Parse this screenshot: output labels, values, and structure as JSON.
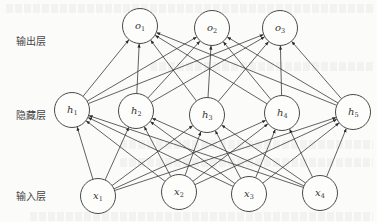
{
  "diagram": {
    "type": "neural-network",
    "direction": "bottom-to-top",
    "connectivity": "fully-connected",
    "layers": [
      {
        "id": "output",
        "label": "输出层",
        "nodes": [
          {
            "id": "o1",
            "symbol": "o",
            "sub": "1"
          },
          {
            "id": "o2",
            "symbol": "o",
            "sub": "2"
          },
          {
            "id": "o3",
            "symbol": "o",
            "sub": "3"
          }
        ]
      },
      {
        "id": "hidden",
        "label": "隐藏层",
        "nodes": [
          {
            "id": "h1",
            "symbol": "h",
            "sub": "1"
          },
          {
            "id": "h2",
            "symbol": "h",
            "sub": "2"
          },
          {
            "id": "h3",
            "symbol": "h",
            "sub": "3"
          },
          {
            "id": "h4",
            "symbol": "h",
            "sub": "4"
          },
          {
            "id": "h5",
            "symbol": "h",
            "sub": "5"
          }
        ]
      },
      {
        "id": "input",
        "label": "输入层",
        "nodes": [
          {
            "id": "x1",
            "symbol": "x",
            "sub": "1"
          },
          {
            "id": "x2",
            "symbol": "x",
            "sub": "2"
          },
          {
            "id": "x3",
            "symbol": "x",
            "sub": "3"
          },
          {
            "id": "x4",
            "symbol": "x",
            "sub": "4"
          }
        ]
      }
    ],
    "edges": [
      {
        "from": "input",
        "to": "hidden"
      },
      {
        "from": "hidden",
        "to": "output"
      }
    ]
  }
}
